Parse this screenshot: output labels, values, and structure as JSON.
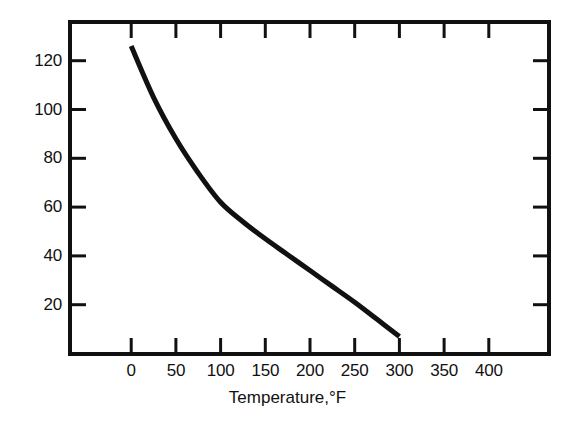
{
  "chart_data": {
    "type": "line",
    "title": "",
    "subtitle": "",
    "xlabel": "Temperature,°F",
    "ylabel": "",
    "xlim": [
      -50,
      450
    ],
    "ylim": [
      0,
      135
    ],
    "grid": false,
    "legend": null,
    "x_ticks": [
      0,
      50,
      100,
      150,
      200,
      250,
      300,
      350,
      400
    ],
    "x_tick_labels": [
      "0",
      "50",
      "100",
      "150",
      "200",
      "250",
      "300",
      "350",
      "400"
    ],
    "y_ticks": [
      20,
      40,
      60,
      80,
      100,
      120
    ],
    "y_tick_labels": [
      "20",
      "40",
      "60",
      "80",
      "100",
      "120"
    ],
    "series": [
      {
        "name": "curve",
        "color": "#111111",
        "x": [
          0,
          25,
          50,
          75,
          100,
          125,
          150,
          175,
          200,
          225,
          250,
          275,
          300
        ],
        "y": [
          126,
          105,
          88,
          74,
          62,
          54,
          47,
          40.5,
          34,
          27.5,
          21,
          14,
          7
        ]
      }
    ],
    "frame_color": "#111111",
    "line_color": "#111111",
    "background": "#ffffff"
  },
  "axis_title": {
    "text": "Temperature,°F"
  }
}
